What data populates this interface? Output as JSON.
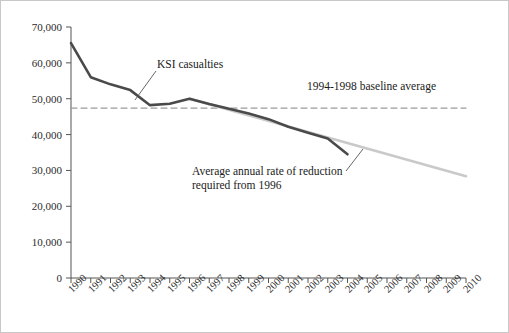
{
  "chart_data": {
    "type": "line",
    "title": "",
    "subtitle": "",
    "xlabel": "",
    "ylabel": "",
    "xlim": [
      1990,
      2010
    ],
    "ylim": [
      0,
      70000
    ],
    "grid": false,
    "legend_position": "none",
    "x": [
      1990,
      1991,
      1992,
      1993,
      1994,
      1995,
      1996,
      1997,
      1998,
      1999,
      2000,
      2001,
      2002,
      2003,
      2004,
      2005,
      2006,
      2007,
      2008,
      2009,
      2010
    ],
    "x_tick_labels": [
      "1990",
      "1991",
      "1992",
      "1993",
      "1994",
      "1995",
      "1996",
      "1997",
      "1998",
      "1999",
      "2000",
      "2001",
      "2002",
      "2003",
      "2004",
      "2005",
      "2006",
      "2007",
      "2008",
      "2009",
      "2010"
    ],
    "y_tick_labels": [
      "0",
      "10,000",
      "20,000",
      "30,000",
      "40,000",
      "50,000",
      "60,000",
      "70,000"
    ],
    "y_tick_values": [
      0,
      10000,
      20000,
      30000,
      40000,
      50000,
      60000,
      70000
    ],
    "series": [
      {
        "name": "KSI casualties",
        "color": "#4a4a4a",
        "style": "solid",
        "width": 2.6,
        "x": [
          1990,
          1991,
          1992,
          1993,
          1994,
          1995,
          1996,
          1997,
          1998,
          1999,
          2000,
          2001,
          2002,
          2003,
          2004
        ],
        "values": [
          65500,
          56000,
          54000,
          52400,
          48200,
          48600,
          50000,
          48500,
          47200,
          45900,
          44300,
          42200,
          40500,
          38900,
          34500
        ]
      },
      {
        "name": "Average annual rate of reduction required from 1996",
        "color": "#c9c9c9",
        "style": "solid",
        "width": 2.6,
        "x": [
          1996,
          2010
        ],
        "values": [
          50000,
          28400
        ]
      },
      {
        "name": "1994-1998 baseline average",
        "color": "#9a9a9a",
        "style": "dashed",
        "width": 1.2,
        "x": [
          1990,
          2010
        ],
        "values": [
          47400,
          47400
        ]
      }
    ],
    "annotations": [
      {
        "id": "ksi-casualties",
        "text": "KSI casualties",
        "lines": [
          "KSI casualties"
        ],
        "points_to_year": 1995,
        "points_to_value": 48600
      },
      {
        "id": "baseline-average",
        "text": "1994-1998 baseline average",
        "lines": [
          "1994-1998 baseline average"
        ],
        "points_to_year": null,
        "points_to_value": 47400
      },
      {
        "id": "rate-of-reduction",
        "text": "Average annual rate of reduction required from 1996",
        "lines": [
          "Average annual rate of reduction",
          "required from 1996"
        ],
        "points_to_year": 2005,
        "points_to_value": 34000
      }
    ]
  },
  "axis": {
    "y_axis_name": "y-axis",
    "x_axis_name": "x-axis"
  }
}
